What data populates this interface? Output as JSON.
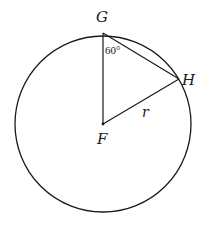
{
  "diagram": {
    "type": "geometry",
    "points": {
      "G": {
        "label": "G",
        "x": 103,
        "y": 33
      },
      "H": {
        "label": "H",
        "x": 179,
        "y": 79
      },
      "F": {
        "label": "F",
        "x": 103,
        "y": 124
      }
    },
    "circle": {
      "center": "F",
      "radius_px": 88
    },
    "segments": [
      {
        "from": "G",
        "to": "F"
      },
      {
        "from": "G",
        "to": "H"
      },
      {
        "from": "F",
        "to": "H",
        "label": "r"
      }
    ],
    "angle_label": {
      "vertex": "G",
      "text": "60°"
    },
    "side_label": "r",
    "colors": {
      "stroke": "#1a1a1a",
      "background": "#ffffff"
    }
  }
}
